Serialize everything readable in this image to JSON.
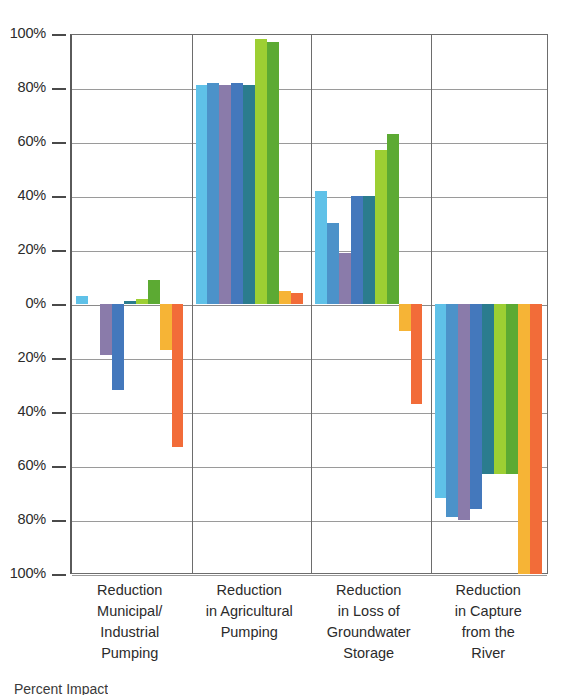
{
  "chart_data": {
    "type": "bar",
    "title": "",
    "xlabel": "",
    "ylabel": "",
    "ylim": [
      -100,
      100
    ],
    "grid": true,
    "legend_position": "none",
    "axis_note": "Y axis tick labels show absolute percent magnitude; values below the 0% line are negative (reductions shown as downward bars).",
    "ytick_labels": [
      "100%",
      "80%",
      "60%",
      "40%",
      "20%",
      "0%",
      "20%",
      "40%",
      "60%",
      "80%",
      "100%"
    ],
    "ytick_values": [
      100,
      80,
      60,
      40,
      20,
      0,
      -20,
      -40,
      -60,
      -80,
      -100
    ],
    "categories": [
      "Reduction Municipal/ Industrial Pumping",
      "Reduction in Agricultural Pumping",
      "Reduction in Loss of Groundwater Storage",
      "Reduction in Capture from the River"
    ],
    "category_lines": [
      [
        "Reduction",
        "Municipal/",
        "Industrial",
        "Pumping"
      ],
      [
        "Reduction",
        "in Agricultural",
        "Pumping"
      ],
      [
        "Reduction",
        "in Loss of",
        "Groundwater",
        "Storage"
      ],
      [
        "Reduction",
        "in Capture",
        "from the",
        "River"
      ]
    ],
    "series": [
      {
        "name": "Series 1",
        "color": "#5FC1E8",
        "values": [
          3,
          81,
          42,
          -72
        ]
      },
      {
        "name": "Series 2",
        "color": "#4C92C9",
        "values": [
          0,
          82,
          30,
          -79
        ]
      },
      {
        "name": "Series 3",
        "color": "#8A7BAA",
        "values": [
          -19,
          81,
          19,
          -80
        ]
      },
      {
        "name": "Series 4",
        "color": "#4478BC",
        "values": [
          -32,
          82,
          40,
          -76
        ]
      },
      {
        "name": "Series 5",
        "color": "#2B7C8E",
        "values": [
          1,
          81,
          40,
          -63
        ]
      },
      {
        "name": "Series 6",
        "color": "#9DCF33",
        "values": [
          2,
          98,
          57,
          -63
        ]
      },
      {
        "name": "Series 7",
        "color": "#5CAA33",
        "values": [
          9,
          97,
          63,
          -63
        ]
      },
      {
        "name": "Series 8",
        "color": "#F6B436",
        "values": [
          -17,
          5,
          -10,
          -100
        ]
      },
      {
        "name": "Series 9",
        "color": "#F26C39",
        "values": [
          -53,
          4,
          -37,
          -100
        ]
      }
    ]
  },
  "caption": {
    "text": "Percent Impact"
  },
  "colors": {
    "axis": "#6d6d6d",
    "grid": "#9a9a9a",
    "text": "#2b2b2b",
    "background": "#ffffff"
  }
}
